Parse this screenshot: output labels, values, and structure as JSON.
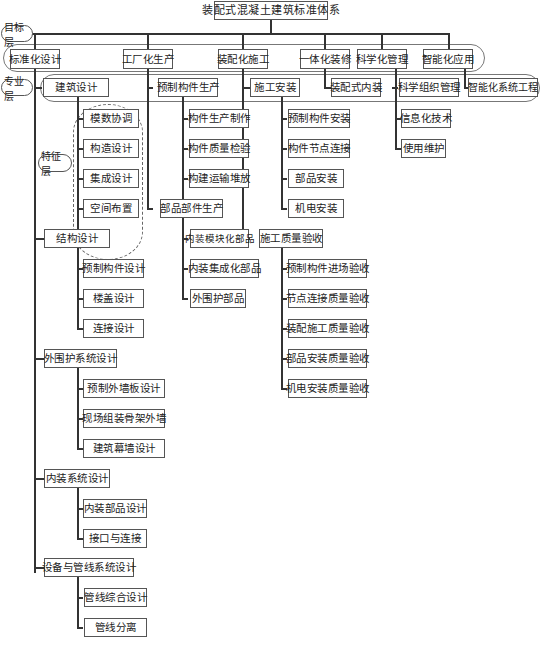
{
  "title": "装配式混凝土建筑标准体系",
  "layers": {
    "goal": "目标层",
    "discipline": "专业层",
    "feature": "特征层"
  },
  "goals": [
    {
      "label": "标准化设计"
    },
    {
      "label": "工厂化生产"
    },
    {
      "label": "装配化施工"
    },
    {
      "label": "一体化装修"
    },
    {
      "label": "科学化管理"
    },
    {
      "label": "智能化应用"
    }
  ],
  "design": {
    "groups": [
      {
        "label": "建筑设计",
        "children": [
          "模数协调",
          "构造设计",
          "集成设计",
          "空间布置"
        ]
      },
      {
        "label": "结构设计",
        "children": [
          "预制构件设计",
          "楼盖设计",
          "连接设计"
        ]
      },
      {
        "label": "外围护系统设计",
        "children": [
          "预制外墙板设计",
          "现场组装骨架外墙",
          "建筑幕墙设计"
        ]
      },
      {
        "label": "内装系统设计",
        "children": [
          "内装部品设计",
          "接口与连接"
        ]
      },
      {
        "label": "设备与管线系统设计",
        "children": [
          "管线综合设计",
          "管线分离"
        ]
      }
    ]
  },
  "production": {
    "groups": [
      {
        "label": "预制构件生产",
        "children": [
          "构件生产制作",
          "构件质量检验",
          "构建运输堆放"
        ]
      },
      {
        "label": "部品部件生产",
        "children": [
          "内装模块化部品",
          "内装集成化部品",
          "外围护部品"
        ]
      }
    ]
  },
  "construction": {
    "groups": [
      {
        "label": "施工安装",
        "children": [
          "预制构件安装",
          "构件节点连接",
          "部品安装",
          "机电安装"
        ]
      },
      {
        "label": "施工质量验收",
        "children": [
          "预制构件进场验收",
          "节点连接质量验收",
          "装配施工质量验收",
          "部品安装质量验收",
          "机电安装质量验收"
        ]
      }
    ]
  },
  "decoration": {
    "label": "装配式内装"
  },
  "management": {
    "label": "科学组织管理",
    "children": [
      "信息化技术",
      "使用维护"
    ]
  },
  "intelligence": {
    "label": "智能化系统工程"
  }
}
